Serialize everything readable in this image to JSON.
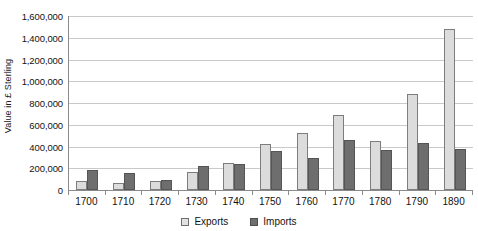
{
  "chart_data": {
    "type": "bar",
    "title": "",
    "xlabel": "",
    "ylabel": "Value in £ Sterling",
    "categories": [
      "1700",
      "1710",
      "1720",
      "1730",
      "1740",
      "1750",
      "1760",
      "1770",
      "1780",
      "1790",
      "1890"
    ],
    "series": [
      {
        "name": "Exports",
        "color": "#dcdcdc",
        "values": [
          80000,
          60000,
          85000,
          170000,
          245000,
          420000,
          520000,
          690000,
          450000,
          885000,
          1480000
        ]
      },
      {
        "name": "Imports",
        "color": "#6e6e6e",
        "values": [
          185000,
          160000,
          90000,
          220000,
          235000,
          355000,
          290000,
          460000,
          365000,
          435000,
          375000
        ]
      }
    ],
    "ylim": [
      0,
      1600000
    ],
    "ytick_values": [
      0,
      200000,
      400000,
      600000,
      800000,
      1000000,
      1200000,
      1400000,
      1600000
    ],
    "ytick_labels": [
      "0",
      "200,000",
      "400,000",
      "600,000",
      "800,000",
      "1,000,000",
      "1,200,000",
      "1,400,000",
      "1,600,000"
    ],
    "grid": true,
    "legend_position": "bottom",
    "legend_entries": [
      "Exports",
      "Imports"
    ]
  }
}
